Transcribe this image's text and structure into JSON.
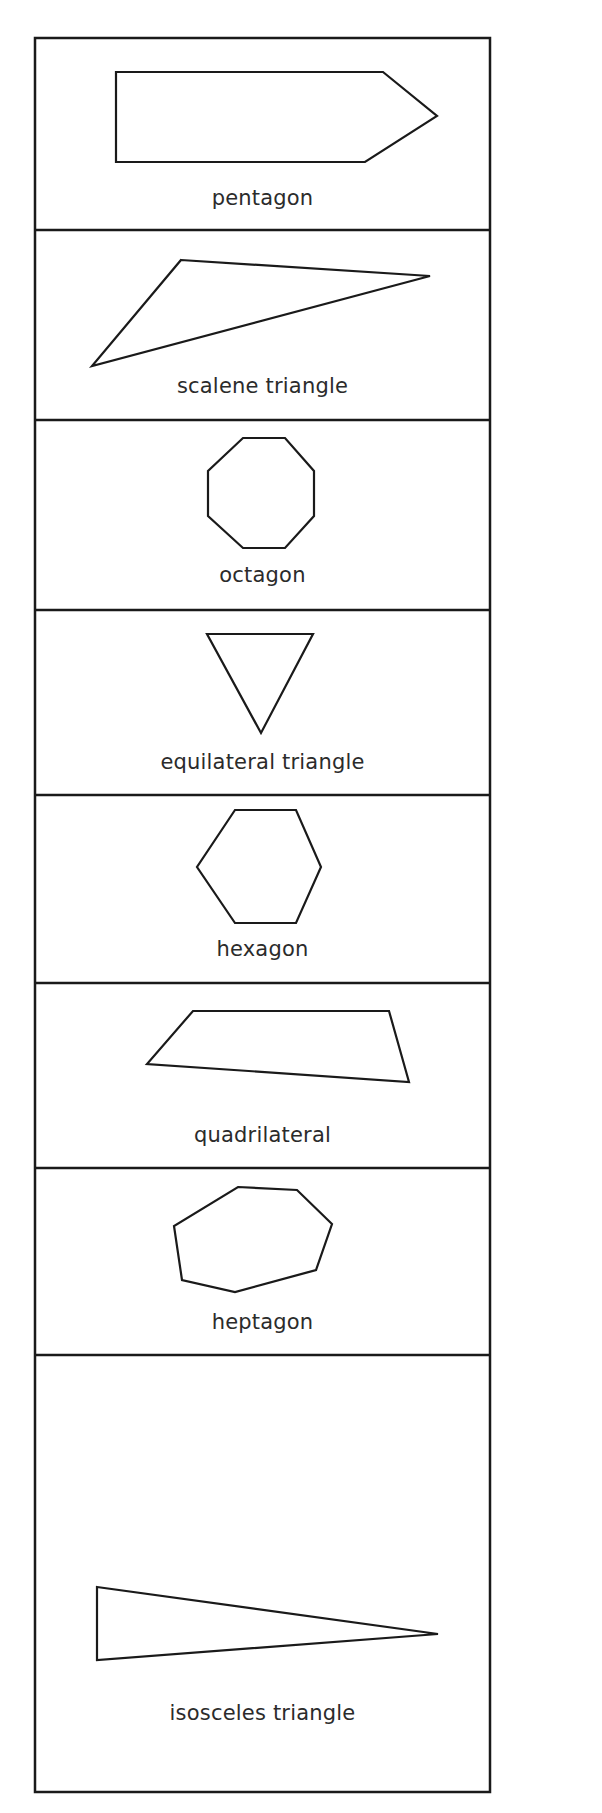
{
  "colors": {
    "stroke": "#1a1a1a",
    "text": "#2b2b2b",
    "background": "#ffffff"
  },
  "frame": {
    "left": 35,
    "top": 38,
    "right": 490,
    "bottom": 1792
  },
  "cells": [
    {
      "label": "pentagon",
      "label_y": 200,
      "shape": {
        "name": "pentagon",
        "points": "116,72 383,72 437,116 365,162 116,162"
      }
    },
    {
      "label": "scalene triangle",
      "label_y": 388,
      "shape": {
        "name": "scalene-triangle",
        "points": "181,260 430,276 92,366"
      }
    },
    {
      "label": "octagon",
      "label_y": 577,
      "shape": {
        "name": "octagon",
        "points": "243,438 285,438 314,471 314,516 285,548 243,548 208,516 208,471"
      }
    },
    {
      "label": "equilateral triangle",
      "label_y": 764,
      "shape": {
        "name": "equilateral-triangle",
        "points": "207,634 313,634 261,733"
      }
    },
    {
      "label": "hexagon",
      "label_y": 951,
      "shape": {
        "name": "hexagon",
        "points": "235,810 296,810 321,867 296,923 235,923 197,867"
      }
    },
    {
      "label": "quadrilateral",
      "label_y": 1137,
      "shape": {
        "name": "quadrilateral",
        "points": "193,1011 389,1011 409,1082 147,1064"
      }
    },
    {
      "label": "heptagon",
      "label_y": 1324,
      "shape": {
        "name": "heptagon",
        "points": "238,1187 297,1190 332,1224 316,1270 235,1292 182,1280 174,1226"
      }
    },
    {
      "label": "isosceles triangle",
      "label_y": 1715,
      "shape": {
        "name": "isosceles-triangle",
        "points": "97,1587 438,1634 97,1660"
      }
    }
  ],
  "dividers": [
    230,
    420,
    610,
    795,
    983,
    1168,
    1355
  ]
}
